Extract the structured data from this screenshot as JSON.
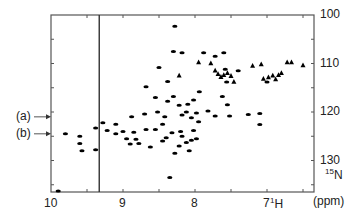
{
  "chart_data": {
    "type": "scatter",
    "title": "",
    "subtitle": "2D 1H-15N HSQC NMR spectrum",
    "xlabel": "1H",
    "ylabel": "15N",
    "unit_label": "(ppm)",
    "xlim": [
      10.0,
      6.35
    ],
    "ylim": [
      100,
      136
    ],
    "x_reversed": true,
    "y_reversed": true,
    "x_ticks": [
      10,
      9,
      8,
      7
    ],
    "x_minor_ticks": [
      9.5,
      8.5,
      7.5,
      6.5
    ],
    "y_ticks": [
      100,
      110,
      120,
      130
    ],
    "y_minor_ticks": [
      105,
      115,
      125,
      135
    ],
    "y_axis_side": "right",
    "grid": false,
    "legend": null,
    "vertical_line_x": 9.33,
    "annotations": [
      {
        "label": "(a)",
        "y": 121.0,
        "arrow_to": "left-axis"
      },
      {
        "label": "(b)",
        "y": 124.5,
        "arrow_to": "left-axis"
      }
    ],
    "peaks": [
      {
        "x": 8.28,
        "y": 102.3,
        "shape": "ellipse"
      },
      {
        "x": 8.3,
        "y": 107.5,
        "shape": "ellipse"
      },
      {
        "x": 8.18,
        "y": 107.8,
        "shape": "ellipse"
      },
      {
        "x": 8.5,
        "y": 110.8,
        "shape": "ellipse"
      },
      {
        "x": 7.88,
        "y": 107.8,
        "shape": "ellipse"
      },
      {
        "x": 7.6,
        "y": 107.8,
        "shape": "ellipse"
      },
      {
        "x": 7.72,
        "y": 108.5,
        "shape": "ellipse"
      },
      {
        "x": 7.95,
        "y": 109.8,
        "shape": "triangle"
      },
      {
        "x": 7.78,
        "y": 110.0,
        "shape": "triangle"
      },
      {
        "x": 7.2,
        "y": 110.5,
        "shape": "triangle"
      },
      {
        "x": 7.08,
        "y": 110.2,
        "shape": "triangle"
      },
      {
        "x": 6.72,
        "y": 109.8,
        "shape": "triangle"
      },
      {
        "x": 6.66,
        "y": 109.8,
        "shape": "triangle"
      },
      {
        "x": 6.5,
        "y": 110.4,
        "shape": "triangle"
      },
      {
        "x": 8.22,
        "y": 112.5,
        "shape": "triangle"
      },
      {
        "x": 7.58,
        "y": 111.2,
        "shape": "ellipse"
      },
      {
        "x": 7.72,
        "y": 111.5,
        "shape": "triangle"
      },
      {
        "x": 7.68,
        "y": 112.2,
        "shape": "triangle"
      },
      {
        "x": 7.64,
        "y": 112.8,
        "shape": "triangle"
      },
      {
        "x": 7.6,
        "y": 112.4,
        "shape": "triangle"
      },
      {
        "x": 7.55,
        "y": 112.0,
        "shape": "triangle"
      },
      {
        "x": 7.5,
        "y": 112.6,
        "shape": "triangle"
      },
      {
        "x": 7.46,
        "y": 113.8,
        "shape": "triangle"
      },
      {
        "x": 7.4,
        "y": 111.5,
        "shape": "ellipse"
      },
      {
        "x": 7.56,
        "y": 113.8,
        "shape": "ellipse"
      },
      {
        "x": 7.05,
        "y": 113.2,
        "shape": "triangle"
      },
      {
        "x": 6.98,
        "y": 112.9,
        "shape": "triangle"
      },
      {
        "x": 6.92,
        "y": 112.5,
        "shape": "triangle"
      },
      {
        "x": 6.88,
        "y": 113.3,
        "shape": "triangle"
      },
      {
        "x": 6.84,
        "y": 112.4,
        "shape": "triangle"
      },
      {
        "x": 6.8,
        "y": 112.0,
        "shape": "triangle"
      },
      {
        "x": 7.0,
        "y": 113.8,
        "shape": "ellipse"
      },
      {
        "x": 8.68,
        "y": 114.8,
        "shape": "ellipse"
      },
      {
        "x": 8.38,
        "y": 113.7,
        "shape": "ellipse"
      },
      {
        "x": 8.55,
        "y": 117.0,
        "shape": "ellipse"
      },
      {
        "x": 8.3,
        "y": 116.8,
        "shape": "ellipse"
      },
      {
        "x": 8.38,
        "y": 117.8,
        "shape": "ellipse"
      },
      {
        "x": 8.22,
        "y": 118.6,
        "shape": "ellipse"
      },
      {
        "x": 8.1,
        "y": 118.4,
        "shape": "ellipse"
      },
      {
        "x": 8.02,
        "y": 117.5,
        "shape": "ellipse"
      },
      {
        "x": 7.94,
        "y": 115.8,
        "shape": "ellipse"
      },
      {
        "x": 7.82,
        "y": 119.8,
        "shape": "ellipse"
      },
      {
        "x": 7.62,
        "y": 116.8,
        "shape": "ellipse"
      },
      {
        "x": 7.55,
        "y": 118.5,
        "shape": "ellipse"
      },
      {
        "x": 8.88,
        "y": 121.0,
        "shape": "ellipse"
      },
      {
        "x": 8.7,
        "y": 120.4,
        "shape": "ellipse"
      },
      {
        "x": 8.52,
        "y": 120.0,
        "shape": "ellipse"
      },
      {
        "x": 8.42,
        "y": 121.0,
        "shape": "ellipse"
      },
      {
        "x": 8.18,
        "y": 120.6,
        "shape": "ellipse"
      },
      {
        "x": 8.05,
        "y": 121.2,
        "shape": "ellipse"
      },
      {
        "x": 7.98,
        "y": 120.2,
        "shape": "ellipse"
      },
      {
        "x": 8.12,
        "y": 120.0,
        "shape": "ellipse"
      },
      {
        "x": 7.95,
        "y": 122.0,
        "shape": "ellipse"
      },
      {
        "x": 7.72,
        "y": 120.8,
        "shape": "ellipse"
      },
      {
        "x": 7.52,
        "y": 120.8,
        "shape": "ellipse"
      },
      {
        "x": 7.26,
        "y": 120.5,
        "shape": "ellipse"
      },
      {
        "x": 7.1,
        "y": 122.6,
        "shape": "ellipse"
      },
      {
        "x": 7.1,
        "y": 120.3,
        "shape": "ellipse"
      },
      {
        "x": 9.28,
        "y": 122.2,
        "shape": "ellipse"
      },
      {
        "x": 9.22,
        "y": 123.8,
        "shape": "ellipse"
      },
      {
        "x": 9.1,
        "y": 122.5,
        "shape": "ellipse"
      },
      {
        "x": 9.1,
        "y": 124.5,
        "shape": "ellipse"
      },
      {
        "x": 9.0,
        "y": 124.0,
        "shape": "ellipse"
      },
      {
        "x": 8.95,
        "y": 125.5,
        "shape": "ellipse"
      },
      {
        "x": 8.9,
        "y": 126.6,
        "shape": "ellipse"
      },
      {
        "x": 8.82,
        "y": 125.6,
        "shape": "ellipse"
      },
      {
        "x": 8.78,
        "y": 126.5,
        "shape": "ellipse"
      },
      {
        "x": 8.85,
        "y": 124.2,
        "shape": "ellipse"
      },
      {
        "x": 8.68,
        "y": 123.6,
        "shape": "ellipse"
      },
      {
        "x": 8.55,
        "y": 123.6,
        "shape": "ellipse"
      },
      {
        "x": 8.45,
        "y": 122.5,
        "shape": "ellipse"
      },
      {
        "x": 8.45,
        "y": 126.0,
        "shape": "ellipse"
      },
      {
        "x": 8.4,
        "y": 125.3,
        "shape": "ellipse"
      },
      {
        "x": 8.32,
        "y": 124.3,
        "shape": "ellipse"
      },
      {
        "x": 8.2,
        "y": 124.0,
        "shape": "ellipse"
      },
      {
        "x": 8.18,
        "y": 125.0,
        "shape": "ellipse"
      },
      {
        "x": 8.12,
        "y": 126.3,
        "shape": "ellipse"
      },
      {
        "x": 8.05,
        "y": 125.8,
        "shape": "ellipse"
      },
      {
        "x": 8.02,
        "y": 123.8,
        "shape": "ellipse"
      },
      {
        "x": 7.98,
        "y": 125.5,
        "shape": "ellipse"
      },
      {
        "x": 8.62,
        "y": 127.2,
        "shape": "ellipse"
      },
      {
        "x": 8.28,
        "y": 128.5,
        "shape": "ellipse"
      },
      {
        "x": 8.22,
        "y": 127.0,
        "shape": "ellipse"
      },
      {
        "x": 8.08,
        "y": 128.0,
        "shape": "ellipse"
      },
      {
        "x": 9.38,
        "y": 123.3,
        "shape": "ellipse"
      },
      {
        "x": 9.38,
        "y": 127.8,
        "shape": "ellipse"
      },
      {
        "x": 9.8,
        "y": 124.5,
        "shape": "ellipse"
      },
      {
        "x": 9.6,
        "y": 125.0,
        "shape": "ellipse"
      },
      {
        "x": 9.6,
        "y": 126.5,
        "shape": "ellipse"
      },
      {
        "x": 9.57,
        "y": 128.0,
        "shape": "ellipse"
      },
      {
        "x": 8.35,
        "y": 133.5,
        "shape": "ellipse"
      },
      {
        "x": 9.9,
        "y": 136.3,
        "shape": "ellipse"
      }
    ]
  }
}
